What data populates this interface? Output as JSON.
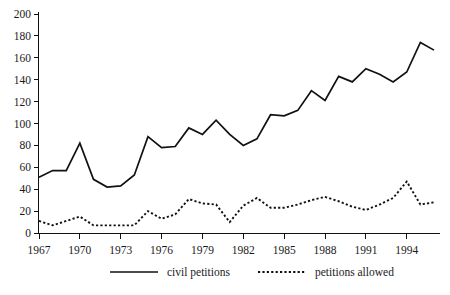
{
  "chart_data": {
    "type": "line",
    "title": "",
    "subtitle": "",
    "xlabel": "",
    "ylabel": "",
    "xlim": [
      1967,
      1996
    ],
    "ylim": [
      0,
      200
    ],
    "grid": false,
    "legend_position": "bottom",
    "x": [
      1967,
      1968,
      1969,
      1970,
      1971,
      1972,
      1973,
      1974,
      1975,
      1976,
      1977,
      1978,
      1979,
      1980,
      1981,
      1982,
      1983,
      1984,
      1985,
      1986,
      1987,
      1988,
      1989,
      1990,
      1991,
      1992,
      1993,
      1994,
      1995,
      1996
    ],
    "xticks": [
      1967,
      1970,
      1973,
      1976,
      1979,
      1982,
      1985,
      1988,
      1991,
      1994
    ],
    "xticklabels": [
      "1967",
      "1970",
      "1973",
      "1976",
      "1979",
      "1982",
      "1985",
      "1988",
      "1991",
      "1994"
    ],
    "yticks": [
      0,
      20,
      40,
      60,
      80,
      100,
      120,
      140,
      160,
      180,
      200
    ],
    "yticklabels": [
      "0",
      "20",
      "40",
      "60",
      "80",
      "100",
      "120",
      "140",
      "160",
      "180",
      "200"
    ],
    "series": [
      {
        "name": "civil petitions",
        "style": "solid",
        "color": "#111111",
        "values": [
          51,
          57,
          57,
          82,
          49,
          42,
          43,
          53,
          88,
          78,
          79,
          96,
          90,
          103,
          90,
          80,
          86,
          108,
          107,
          112,
          130,
          121,
          143,
          138,
          150,
          145,
          138,
          147,
          174,
          167
        ]
      },
      {
        "name": "petitions allowed",
        "style": "dotted",
        "color": "#111111",
        "values": [
          11,
          7,
          11,
          15,
          7,
          7,
          7,
          7,
          20,
          13,
          17,
          31,
          27,
          26,
          10,
          25,
          32,
          23,
          23,
          26,
          30,
          33,
          29,
          24,
          21,
          26,
          32,
          47,
          26,
          28
        ]
      }
    ]
  },
  "legend": {
    "items": [
      {
        "label": "civil petitions",
        "style": "solid"
      },
      {
        "label": "petitions allowed",
        "style": "dotted"
      }
    ]
  }
}
